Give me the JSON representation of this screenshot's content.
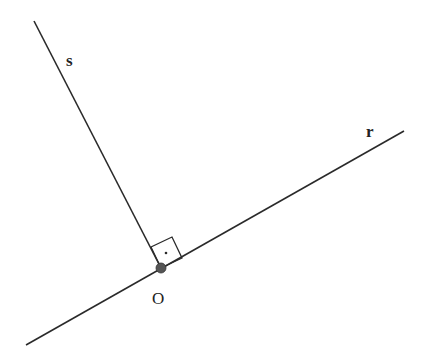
{
  "diagram": {
    "title": "",
    "colors": {
      "line": "#2a2a2a",
      "point": "#555555",
      "background": "#ffffff"
    },
    "lines": [
      {
        "id": "r",
        "label": "r",
        "from": [
          26,
          345
        ],
        "to": [
          404,
          131
        ],
        "label_pos": [
          366,
          137
        ]
      },
      {
        "id": "s",
        "label": "s",
        "from": [
          34,
          21
        ],
        "to": [
          161,
          268
        ],
        "label_pos": [
          66,
          66
        ]
      }
    ],
    "points": [
      {
        "id": "O",
        "label": "O",
        "pos": [
          161,
          268
        ],
        "label_pos": [
          152,
          304
        ]
      }
    ],
    "right_angle_marker": {
      "vertex": [
        161,
        268
      ],
      "corners": [
        [
          161,
          268
        ],
        [
          151,
          247
        ],
        [
          172,
          237
        ],
        [
          182,
          258
        ]
      ],
      "dot": [
        166,
        253
      ]
    }
  }
}
